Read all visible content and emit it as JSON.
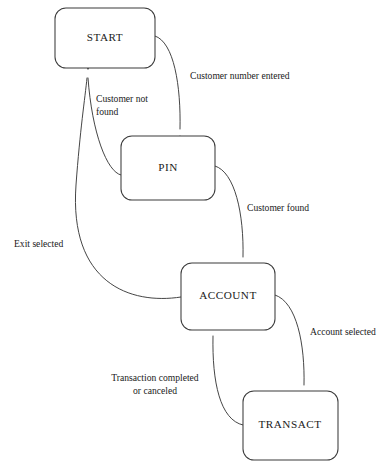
{
  "diagram": {
    "type": "state-transition-diagram",
    "background_color": "#ffffff",
    "line_color": "#3b3b3b",
    "text_color": "#1a1a1a",
    "states": [
      {
        "id": "start",
        "label": "START",
        "x": 55,
        "y": 8,
        "width": 100,
        "height": 60,
        "cx": 105,
        "cy": 38
      },
      {
        "id": "pin",
        "label": "PIN",
        "x": 121,
        "y": 136,
        "width": 94,
        "height": 64,
        "cx": 168,
        "cy": 168
      },
      {
        "id": "account",
        "label": "ACCOUNT",
        "x": 181,
        "y": 263,
        "width": 94,
        "height": 67,
        "cx": 228,
        "cy": 296
      },
      {
        "id": "transact",
        "label": "TRANSACT",
        "x": 243,
        "y": 391,
        "width": 95,
        "height": 69,
        "cx": 290,
        "cy": 425
      }
    ],
    "transitions": [
      {
        "id": "start-to-pin",
        "from": "START",
        "to": "PIN",
        "label": "Customer number entered",
        "label_lines": [
          "Customer number entered"
        ],
        "label_x": 190,
        "label_y": 79,
        "label_align": "start",
        "path": "M 155 36 C 174 42 181 86 180 129",
        "arrow": {
          "x": 180,
          "y": 135,
          "angle": 90
        }
      },
      {
        "id": "pin-to-start",
        "from": "PIN",
        "to": "START",
        "label": "Customer not found",
        "label_lines": [
          "Customer not",
          "found"
        ],
        "label_x": 96,
        "label_y": 102,
        "label_align": "start",
        "path": "M 121 175 C 107 172 92 133 88 78",
        "arrow": {
          "x": 88,
          "y": 70,
          "angle": -90
        }
      },
      {
        "id": "pin-to-account",
        "from": "PIN",
        "to": "ACCOUNT",
        "label": "Customer found",
        "label_lines": [
          "Customer found"
        ],
        "label_x": 247,
        "label_y": 211,
        "label_align": "start",
        "path": "M 215 166 C 235 172 244 214 243 257",
        "arrow": {
          "x": 243,
          "y": 263,
          "angle": 90
        }
      },
      {
        "id": "account-to-start",
        "from": "ACCOUNT",
        "to": "START",
        "label": "Exit selected",
        "label_lines": [
          "Exit selected"
        ],
        "label_x": 14,
        "label_y": 247,
        "label_align": "start",
        "path": "M 181 297 C 130 305 69 283 76 185 C 80 130 85 98 87 78",
        "arrow": {
          "x": 88,
          "y": 70,
          "angle": -90
        }
      },
      {
        "id": "account-to-transact",
        "from": "ACCOUNT",
        "to": "TRANSACT",
        "label": "Account selected",
        "label_lines": [
          "Account selected"
        ],
        "label_x": 310,
        "label_y": 335,
        "label_align": "start",
        "path": "M 275 295 C 297 302 305 345 304 385",
        "arrow": {
          "x": 304,
          "y": 391,
          "angle": 90
        }
      },
      {
        "id": "transact-to-account",
        "from": "TRANSACT",
        "to": "ACCOUNT",
        "label": "Transaction completed or canceled",
        "label_lines": [
          "Transaction completed",
          "or canceled"
        ],
        "label_x": 155,
        "label_y": 381,
        "label_align": "center",
        "path": "M 243 425 C 220 420 212 382 213 336",
        "arrow": {
          "x": 213,
          "y": 330,
          "angle": -90
        }
      }
    ]
  }
}
